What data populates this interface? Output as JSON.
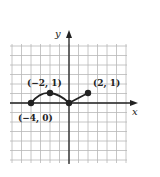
{
  "chart_data": {
    "type": "line",
    "title": "",
    "xlabel": "x",
    "ylabel": "y",
    "grid": true,
    "xlim": [
      -6,
      6
    ],
    "ylim": [
      -6,
      6
    ],
    "series": [
      {
        "name": "curve",
        "segments": [
          {
            "shape": "arc",
            "points": [
              [
                -4,
                0
              ],
              [
                -2,
                1
              ],
              [
                0,
                0
              ]
            ]
          },
          {
            "shape": "line",
            "points": [
              [
                0,
                0
              ],
              [
                2,
                1
              ]
            ]
          }
        ],
        "x": [
          -4,
          -2,
          0,
          2
        ],
        "y": [
          0,
          1,
          0,
          1
        ]
      }
    ],
    "annotations": [
      {
        "text": "(−4, 0)",
        "x": -4,
        "y": 0
      },
      {
        "text": "(−2, 1)",
        "x": -2,
        "y": 1
      },
      {
        "text": "(2, 1)",
        "x": 2,
        "y": 1
      }
    ]
  },
  "labels": {
    "x_axis": "x",
    "y_axis": "y",
    "p1": "(−4, 0)",
    "p2": "(−2, 1)",
    "p3": "(2, 1)"
  },
  "colors": {
    "grid": "#b8b8b8",
    "axis": "#222222",
    "curve": "#222222"
  }
}
